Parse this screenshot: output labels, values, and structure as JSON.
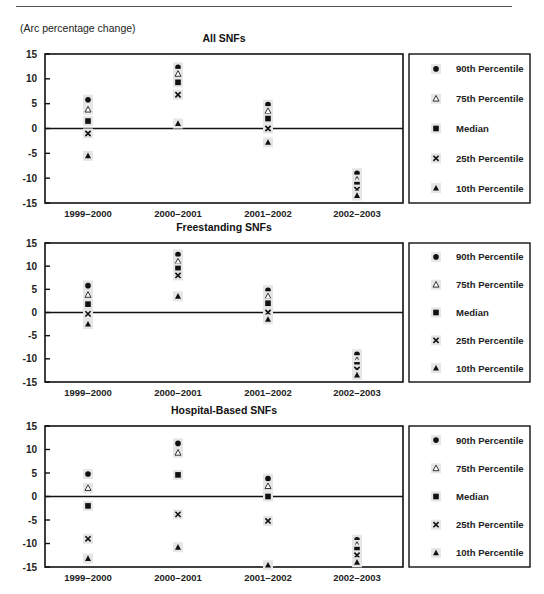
{
  "page": {
    "unit_label": "(Arc percentage change)"
  },
  "legend": {
    "items": [
      {
        "key": "p90",
        "label": "90th Percentile",
        "marker": "circle"
      },
      {
        "key": "p75",
        "label": "75th Percentile",
        "marker": "triangle-open"
      },
      {
        "key": "median",
        "label": "Median",
        "marker": "square"
      },
      {
        "key": "p25",
        "label": "25th Percentile",
        "marker": "x"
      },
      {
        "key": "p10",
        "label": "10th Percentile",
        "marker": "triangle-filled"
      }
    ]
  },
  "panels": [
    {
      "title": "All SNFs"
    },
    {
      "title": "Freestanding SNFs"
    },
    {
      "title": "Hospital-Based SNFs"
    }
  ],
  "chart_data": [
    {
      "type": "scatter",
      "title": "All SNFs",
      "ylabel": "(Arc percentage change)",
      "xlabel": "",
      "ylim": [
        -15,
        15
      ],
      "yticks": [
        15,
        10,
        5,
        0,
        -5,
        -10,
        -15
      ],
      "grid": false,
      "legend_position": "right",
      "categories": [
        "1999-2000",
        "2000-2001",
        "2001-2002",
        "2002-2003"
      ],
      "series": [
        {
          "name": "90th Percentile",
          "values": [
            5.8,
            12.3,
            4.8,
            -9.0
          ]
        },
        {
          "name": "75th Percentile",
          "values": [
            3.8,
            11.0,
            3.5,
            -10.3
          ]
        },
        {
          "name": "Median",
          "values": [
            1.5,
            9.3,
            2.0,
            -11.3
          ]
        },
        {
          "name": "25th Percentile",
          "values": [
            -1.0,
            6.8,
            0.0,
            -12.3
          ]
        },
        {
          "name": "10th Percentile",
          "values": [
            -5.5,
            1.0,
            -2.8,
            -13.5
          ]
        }
      ]
    },
    {
      "type": "scatter",
      "title": "Freestanding SNFs",
      "ylabel": "(Arc percentage change)",
      "xlabel": "",
      "ylim": [
        -15,
        15
      ],
      "yticks": [
        15,
        10,
        5,
        0,
        -5,
        -10,
        -15
      ],
      "grid": false,
      "legend_position": "right",
      "categories": [
        "1999-2000",
        "2000-2001",
        "2001-2002",
        "2002-2003"
      ],
      "series": [
        {
          "name": "90th Percentile",
          "values": [
            5.8,
            12.5,
            4.8,
            -9.0
          ]
        },
        {
          "name": "75th Percentile",
          "values": [
            3.8,
            11.0,
            3.5,
            -10.3
          ]
        },
        {
          "name": "Median",
          "values": [
            1.8,
            9.5,
            2.0,
            -11.3
          ]
        },
        {
          "name": "25th Percentile",
          "values": [
            -0.3,
            8.0,
            0.0,
            -12.3
          ]
        },
        {
          "name": "10th Percentile",
          "values": [
            -2.5,
            3.5,
            -1.5,
            -13.5
          ]
        }
      ]
    },
    {
      "type": "scatter",
      "title": "Hospital-Based SNFs",
      "ylabel": "(Arc percentage change)",
      "xlabel": "",
      "ylim": [
        -15,
        15
      ],
      "yticks": [
        15,
        10,
        5,
        0,
        -5,
        -10,
        -15
      ],
      "grid": false,
      "legend_position": "right",
      "categories": [
        "1999-2000",
        "2000-2001",
        "2001-2002",
        "2002-2003"
      ],
      "series": [
        {
          "name": "90th Percentile",
          "values": [
            4.8,
            11.3,
            3.8,
            -9.2
          ]
        },
        {
          "name": "75th Percentile",
          "values": [
            1.8,
            9.3,
            2.2,
            -10.3
          ]
        },
        {
          "name": "Median",
          "values": [
            -2.0,
            4.6,
            0.0,
            -11.3
          ]
        },
        {
          "name": "25th Percentile",
          "values": [
            -9.0,
            -3.8,
            -5.2,
            -12.5
          ]
        },
        {
          "name": "10th Percentile",
          "values": [
            -13.2,
            -10.8,
            -14.6,
            -14.0
          ]
        }
      ]
    }
  ]
}
